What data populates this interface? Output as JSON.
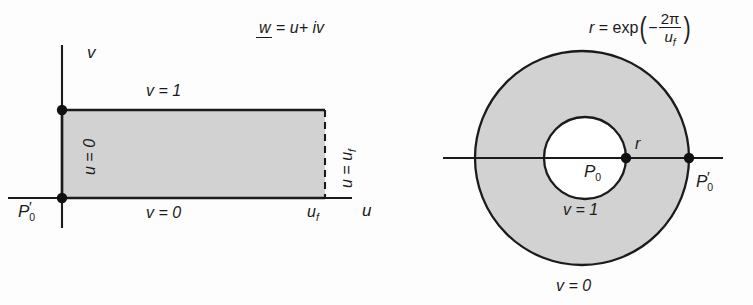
{
  "figure": {
    "title_left_formula_parts": {
      "w": "w",
      "equals": " = ",
      "rhs": "u+ iv"
    },
    "title_right_formula_parts": {
      "r": "r",
      "equals": " = ",
      "exp": "exp",
      "minus": "−",
      "numerator": "2π",
      "denominator_base": "u",
      "denominator_sub": "f"
    }
  },
  "left_panel": {
    "name": "w-plane rectangle diagram",
    "axis_v_label": "v",
    "axis_u_label": "u",
    "top_edge_label": "v = 1",
    "bottom_edge_label": "v = 0",
    "left_edge_label": "u = 0",
    "right_edge_label_base": "u = u",
    "right_edge_label_sub": "f",
    "u_f_tick_base": "u",
    "u_f_tick_sub": "f",
    "corner_point_label_base": "P",
    "corner_point_label_sub": "0",
    "corner_point_label_prime": "′"
  },
  "right_panel": {
    "name": "annulus diagram",
    "inner_radius_label": "r",
    "center_point_label_base": "P",
    "center_point_label_sub": "0",
    "inner_circle_label": "v = 1",
    "outer_circle_label": "v = 0",
    "outer_point_label_base": "P",
    "outer_point_label_sub": "0",
    "outer_point_label_prime": "′"
  },
  "colors": {
    "fill_gray": "#d2d2d2",
    "stroke": "#1b1b1b",
    "background": "#fdfdfd"
  },
  "geometry": {
    "rect": {
      "x": 62,
      "y": 110,
      "width": 263,
      "height": 88
    },
    "v_axis": {
      "x": 62,
      "y1": 45,
      "y2": 228
    },
    "u_axis": {
      "y": 198,
      "x1": 8,
      "x2": 352
    },
    "outer_circle": {
      "cx": 582,
      "cy": 158,
      "r": 107
    },
    "inner_circle": {
      "cx": 585,
      "cy": 158,
      "r": 41
    },
    "horizontal_line": {
      "y": 158,
      "x1": 443,
      "x2": 723
    }
  }
}
